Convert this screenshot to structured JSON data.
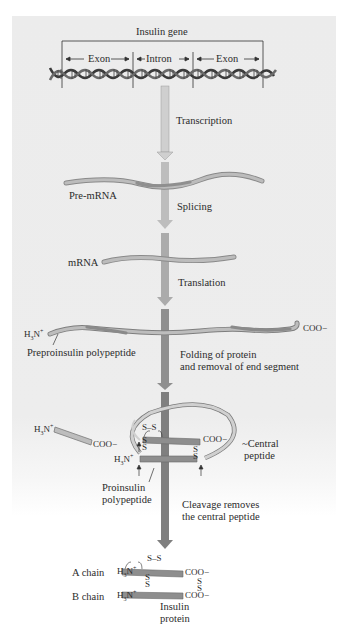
{
  "figure": {
    "title": "Insulin gene",
    "gene_segments": [
      "Exon",
      "Intron",
      "Exon"
    ],
    "steps": [
      {
        "label": "Transcription"
      },
      {
        "label": "Splicing"
      },
      {
        "label": "Translation"
      },
      {
        "label_line1": "Folding of protein",
        "label_line2": "and removal of end segment"
      },
      {
        "label_line1": "Cleavage removes",
        "label_line2": "the central peptide"
      }
    ],
    "molecules": {
      "pre_mrna": "Pre-mRNA",
      "mrna": "mRNA",
      "preproinsulin": "Preproinsulin polypeptide",
      "proinsulin_line1": "Proinsulin",
      "proinsulin_line2": "polypeptide",
      "central_peptide_line1": "Central",
      "central_peptide_line2": "peptide",
      "a_chain": "A chain",
      "b_chain": "B chain",
      "insulin_line1": "Insulin",
      "insulin_line2": "protein"
    },
    "termini": {
      "n_terminus": "H3N+",
      "c_terminus": "COO−"
    },
    "bonds": {
      "disulfide": "S–S",
      "s": "S"
    },
    "colors": {
      "background": "#ececec",
      "arrow_light": "#c9c9c9",
      "arrow_mid": "#a6a6a6",
      "arrow_dark": "#7d7d7d",
      "strand_light": "#b8b8b8",
      "strand_dark": "#8e8e8e",
      "text": "#2b2b2b"
    }
  }
}
